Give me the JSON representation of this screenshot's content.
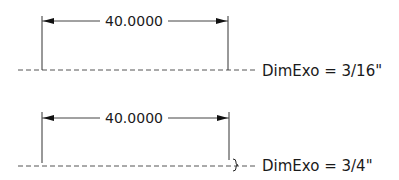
{
  "diagrams": [
    {
      "dimension_text": "40.0000",
      "label": "DimExo = 3/16\"",
      "dimexo": "3/16\""
    },
    {
      "dimension_text": "40.0000",
      "label": "DimExo = 3/4\"",
      "dimexo": "3/4\""
    }
  ],
  "colors": {
    "line": "#333333",
    "text": "#1a1a1a",
    "background": "#ffffff"
  }
}
